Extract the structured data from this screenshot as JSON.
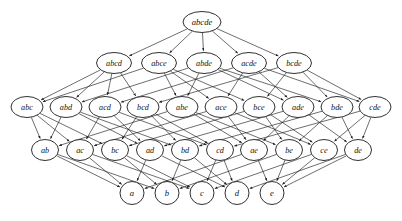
{
  "figure": {
    "kind": "hasse-diagram",
    "background_color": "#ffffff",
    "node_fill": "#ffffff",
    "node_stroke": "#1a1a1a",
    "edge_color": "#1f1f1f",
    "label_style": "italic-serif",
    "edge_direction": "downward",
    "width": 402,
    "height": 221
  },
  "chart_data": {
    "type": "diagram",
    "title": "",
    "xlabel": "",
    "ylabel": "",
    "levels": [
      {
        "rank": 5,
        "y": 22,
        "node_rx": 19,
        "node_ry": 10.5,
        "font_size": 8.6,
        "nodes": [
          {
            "id": "abcde",
            "label": "abcde",
            "x": 202
          }
        ]
      },
      {
        "rank": 4,
        "y": 63,
        "node_rx": 17.5,
        "node_ry": 10.5,
        "font_size": 8.2,
        "nodes": [
          {
            "id": "abcd",
            "label": "abcd",
            "x": 114
          },
          {
            "id": "abce",
            "label": "abce",
            "x": 159
          },
          {
            "id": "abde",
            "label": "abde",
            "x": 204
          },
          {
            "id": "acde",
            "label": "acde",
            "x": 249
          },
          {
            "id": "bcde",
            "label": "bcde",
            "x": 294
          }
        ]
      },
      {
        "rank": 3,
        "y": 107,
        "node_rx": 16,
        "node_ry": 10.5,
        "font_size": 8.2,
        "nodes": [
          {
            "id": "abc",
            "label": "abc",
            "x": 27
          },
          {
            "id": "abd",
            "label": "abd",
            "x": 66
          },
          {
            "id": "acd",
            "label": "acd",
            "x": 105
          },
          {
            "id": "bcd",
            "label": "bcd",
            "x": 143
          },
          {
            "id": "abe",
            "label": "abe",
            "x": 182
          },
          {
            "id": "ace",
            "label": "ace",
            "x": 221
          },
          {
            "id": "bce",
            "label": "bce",
            "x": 259
          },
          {
            "id": "ade",
            "label": "ade",
            "x": 298
          },
          {
            "id": "bde",
            "label": "bde",
            "x": 337
          },
          {
            "id": "cde",
            "label": "cde",
            "x": 375
          }
        ]
      },
      {
        "rank": 2,
        "y": 150,
        "node_rx": 13.5,
        "node_ry": 10.5,
        "font_size": 8.2,
        "nodes": [
          {
            "id": "ab",
            "label": "ab",
            "x": 45
          },
          {
            "id": "ac",
            "label": "ac",
            "x": 80
          },
          {
            "id": "bc",
            "label": "bc",
            "x": 115
          },
          {
            "id": "ad",
            "label": "ad",
            "x": 150
          },
          {
            "id": "bd",
            "label": "bd",
            "x": 185
          },
          {
            "id": "cd",
            "label": "cd",
            "x": 220
          },
          {
            "id": "ae",
            "label": "ae",
            "x": 254
          },
          {
            "id": "be",
            "label": "be",
            "x": 289
          },
          {
            "id": "ce",
            "label": "ce",
            "x": 324
          },
          {
            "id": "de",
            "label": "de",
            "x": 358
          }
        ]
      },
      {
        "rank": 1,
        "y": 193,
        "node_rx": 12,
        "node_ry": 11.5,
        "font_size": 8.6,
        "nodes": [
          {
            "id": "a",
            "label": "a",
            "x": 132
          },
          {
            "id": "b",
            "label": "b",
            "x": 167
          },
          {
            "id": "c",
            "label": "c",
            "x": 202
          },
          {
            "id": "d",
            "label": "d",
            "x": 237
          },
          {
            "id": "e",
            "label": "e",
            "x": 272
          }
        ]
      }
    ],
    "edges": [
      [
        "abcde",
        "abcd"
      ],
      [
        "abcde",
        "abce"
      ],
      [
        "abcde",
        "abde"
      ],
      [
        "abcde",
        "acde"
      ],
      [
        "abcde",
        "bcde"
      ],
      [
        "abcd",
        "abc"
      ],
      [
        "abcd",
        "abd"
      ],
      [
        "abcd",
        "acd"
      ],
      [
        "abcd",
        "bcd"
      ],
      [
        "abce",
        "abc"
      ],
      [
        "abce",
        "abe"
      ],
      [
        "abce",
        "ace"
      ],
      [
        "abce",
        "bce"
      ],
      [
        "abde",
        "abd"
      ],
      [
        "abde",
        "abe"
      ],
      [
        "abde",
        "ade"
      ],
      [
        "abde",
        "bde"
      ],
      [
        "acde",
        "acd"
      ],
      [
        "acde",
        "ace"
      ],
      [
        "acde",
        "ade"
      ],
      [
        "acde",
        "cde"
      ],
      [
        "bcde",
        "bcd"
      ],
      [
        "bcde",
        "bce"
      ],
      [
        "bcde",
        "bde"
      ],
      [
        "bcde",
        "cde"
      ],
      [
        "abc",
        "ab"
      ],
      [
        "abc",
        "ac"
      ],
      [
        "abc",
        "bc"
      ],
      [
        "abd",
        "ab"
      ],
      [
        "abd",
        "ad"
      ],
      [
        "abd",
        "bd"
      ],
      [
        "acd",
        "ac"
      ],
      [
        "acd",
        "ad"
      ],
      [
        "acd",
        "cd"
      ],
      [
        "bcd",
        "bc"
      ],
      [
        "bcd",
        "bd"
      ],
      [
        "bcd",
        "cd"
      ],
      [
        "abe",
        "ab"
      ],
      [
        "abe",
        "ae"
      ],
      [
        "abe",
        "be"
      ],
      [
        "ace",
        "ac"
      ],
      [
        "ace",
        "ae"
      ],
      [
        "ace",
        "ce"
      ],
      [
        "bce",
        "bc"
      ],
      [
        "bce",
        "be"
      ],
      [
        "bce",
        "ce"
      ],
      [
        "ade",
        "ad"
      ],
      [
        "ade",
        "ae"
      ],
      [
        "ade",
        "de"
      ],
      [
        "bde",
        "bd"
      ],
      [
        "bde",
        "be"
      ],
      [
        "bde",
        "de"
      ],
      [
        "cde",
        "cd"
      ],
      [
        "cde",
        "ce"
      ],
      [
        "cde",
        "de"
      ],
      [
        "ab",
        "a"
      ],
      [
        "ab",
        "b"
      ],
      [
        "ac",
        "a"
      ],
      [
        "ac",
        "c"
      ],
      [
        "bc",
        "b"
      ],
      [
        "bc",
        "c"
      ],
      [
        "ad",
        "a"
      ],
      [
        "ad",
        "d"
      ],
      [
        "bd",
        "b"
      ],
      [
        "bd",
        "d"
      ],
      [
        "cd",
        "c"
      ],
      [
        "cd",
        "d"
      ],
      [
        "ae",
        "a"
      ],
      [
        "ae",
        "e"
      ],
      [
        "be",
        "b"
      ],
      [
        "be",
        "e"
      ],
      [
        "ce",
        "c"
      ],
      [
        "ce",
        "e"
      ],
      [
        "de",
        "d"
      ],
      [
        "de",
        "e"
      ]
    ]
  }
}
